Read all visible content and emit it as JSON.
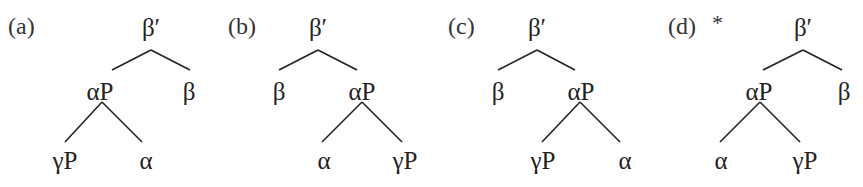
{
  "colors": {
    "ink": "#222222",
    "background": "#ffffff"
  },
  "trees": [
    {
      "id": "a",
      "label": "(a)",
      "mark": "",
      "root": {
        "text": "β′",
        "x": 151,
        "y": 15
      },
      "level1": {
        "left": {
          "text": "αP",
          "x": 100,
          "y": 79
        },
        "right": {
          "text": "β",
          "x": 189,
          "y": 79
        }
      },
      "level2": {
        "left": {
          "text": "γP",
          "x": 65,
          "y": 148
        },
        "right": {
          "text": "α",
          "x": 146,
          "y": 148
        }
      },
      "tag_x": 8
    },
    {
      "id": "b",
      "label": "(b)",
      "mark": "",
      "root": {
        "text": "β′",
        "x": 318,
        "y": 15
      },
      "level1": {
        "left": {
          "text": "β",
          "x": 279,
          "y": 79
        },
        "right": {
          "text": "αP",
          "x": 362,
          "y": 79
        }
      },
      "level2": {
        "left": {
          "text": "α",
          "x": 324,
          "y": 148
        },
        "right": {
          "text": "γP",
          "x": 405,
          "y": 148
        }
      },
      "tag_x": 228
    },
    {
      "id": "c",
      "label": "(c)",
      "mark": "",
      "root": {
        "text": "β′",
        "x": 537,
        "y": 15
      },
      "level1": {
        "left": {
          "text": "β",
          "x": 498,
          "y": 79
        },
        "right": {
          "text": "αP",
          "x": 581,
          "y": 79
        }
      },
      "level2": {
        "left": {
          "text": "γP",
          "x": 543,
          "y": 148
        },
        "right": {
          "text": "α",
          "x": 625,
          "y": 148
        }
      },
      "tag_x": 448
    },
    {
      "id": "d",
      "label": "(d)",
      "mark": "*",
      "root": {
        "text": "β′",
        "x": 803,
        "y": 15
      },
      "level1": {
        "left": {
          "text": "αP",
          "x": 759,
          "y": 79
        },
        "right": {
          "text": "β",
          "x": 844,
          "y": 79
        }
      },
      "level2": {
        "left": {
          "text": "α",
          "x": 721,
          "y": 148
        },
        "right": {
          "text": "γP",
          "x": 805,
          "y": 148
        }
      },
      "tag_x": 668
    }
  ],
  "edges": [
    {
      "tree": "a",
      "x1": 151,
      "y1": 50,
      "x2": 112,
      "y2": 70
    },
    {
      "tree": "a",
      "x1": 151,
      "y1": 50,
      "x2": 190,
      "y2": 70
    },
    {
      "tree": "a",
      "x1": 102,
      "y1": 102,
      "x2": 65,
      "y2": 142
    },
    {
      "tree": "a",
      "x1": 102,
      "y1": 102,
      "x2": 142,
      "y2": 142
    },
    {
      "tree": "b",
      "x1": 318,
      "y1": 50,
      "x2": 279,
      "y2": 70
    },
    {
      "tree": "b",
      "x1": 318,
      "y1": 50,
      "x2": 357,
      "y2": 70
    },
    {
      "tree": "b",
      "x1": 362,
      "y1": 102,
      "x2": 322,
      "y2": 142
    },
    {
      "tree": "b",
      "x1": 362,
      "y1": 102,
      "x2": 402,
      "y2": 142
    },
    {
      "tree": "c",
      "x1": 537,
      "y1": 50,
      "x2": 498,
      "y2": 70
    },
    {
      "tree": "c",
      "x1": 537,
      "y1": 50,
      "x2": 575,
      "y2": 70
    },
    {
      "tree": "c",
      "x1": 580,
      "y1": 102,
      "x2": 542,
      "y2": 142
    },
    {
      "tree": "c",
      "x1": 580,
      "y1": 102,
      "x2": 620,
      "y2": 142
    },
    {
      "tree": "d",
      "x1": 803,
      "y1": 50,
      "x2": 763,
      "y2": 70
    },
    {
      "tree": "d",
      "x1": 803,
      "y1": 50,
      "x2": 842,
      "y2": 70
    },
    {
      "tree": "d",
      "x1": 760,
      "y1": 102,
      "x2": 720,
      "y2": 142
    },
    {
      "tree": "d",
      "x1": 760,
      "y1": 102,
      "x2": 800,
      "y2": 142
    }
  ]
}
